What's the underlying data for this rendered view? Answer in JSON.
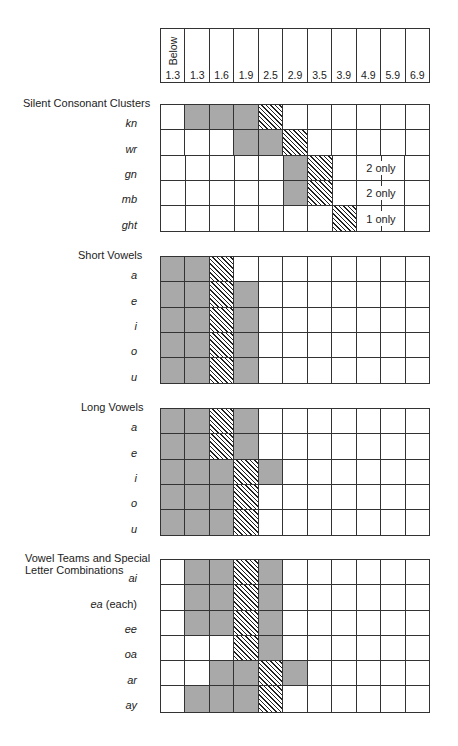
{
  "chart_data": {
    "type": "table",
    "title": "",
    "legend": {
      "gray": "shaded cell",
      "hatched": "diagonally hatched cell"
    },
    "columns": [
      "Below 1.3",
      "1.3",
      "1.6",
      "1.9",
      "2.5",
      "2.9",
      "3.5",
      "3.9",
      "4.9",
      "5.9",
      "6.9"
    ],
    "header": {
      "below_label": "Below",
      "values": [
        "1.3",
        "1.3",
        "1.6",
        "1.9",
        "2.5",
        "2.9",
        "3.5",
        "3.9",
        "4.9",
        "5.9",
        "6.9"
      ]
    },
    "sections": [
      {
        "title": "Silent Consonant Clusters",
        "rows": [
          {
            "label": "kn",
            "cells": [
              "",
              "g",
              "g",
              "g",
              "h",
              "",
              "",
              "",
              "",
              "",
              ""
            ]
          },
          {
            "label": "wr",
            "cells": [
              "",
              "",
              "",
              "g",
              "g",
              "h",
              "",
              "",
              "",
              "",
              ""
            ]
          },
          {
            "label": "gn",
            "cells": [
              "",
              "",
              "",
              "",
              "",
              "g",
              "h",
              "",
              "",
              "",
              ""
            ],
            "note": "2 only"
          },
          {
            "label": "mb",
            "cells": [
              "",
              "",
              "",
              "",
              "",
              "g",
              "h",
              "",
              "",
              "",
              ""
            ],
            "note": "2 only"
          },
          {
            "label": "ght",
            "cells": [
              "",
              "",
              "",
              "",
              "",
              "",
              "",
              "h",
              "",
              "",
              ""
            ],
            "note": "1 only"
          }
        ]
      },
      {
        "title": "Short Vowels",
        "rows": [
          {
            "label": "a",
            "cells": [
              "g",
              "g",
              "h",
              "",
              "",
              "",
              "",
              "",
              "",
              "",
              ""
            ]
          },
          {
            "label": "e",
            "cells": [
              "g",
              "g",
              "h",
              "g",
              "",
              "",
              "",
              "",
              "",
              "",
              ""
            ]
          },
          {
            "label": "i",
            "cells": [
              "g",
              "g",
              "h",
              "g",
              "",
              "",
              "",
              "",
              "",
              "",
              ""
            ]
          },
          {
            "label": "o",
            "cells": [
              "g",
              "g",
              "h",
              "g",
              "",
              "",
              "",
              "",
              "",
              "",
              ""
            ]
          },
          {
            "label": "u",
            "cells": [
              "g",
              "g",
              "h",
              "g",
              "",
              "",
              "",
              "",
              "",
              "",
              ""
            ]
          }
        ]
      },
      {
        "title": "Long Vowels",
        "rows": [
          {
            "label": "a",
            "cells": [
              "g",
              "g",
              "h",
              "g",
              "",
              "",
              "",
              "",
              "",
              "",
              ""
            ]
          },
          {
            "label": "e",
            "cells": [
              "g",
              "g",
              "h",
              "g",
              "",
              "",
              "",
              "",
              "",
              "",
              ""
            ]
          },
          {
            "label": "i",
            "cells": [
              "g",
              "g",
              "g",
              "h",
              "g",
              "",
              "",
              "",
              "",
              "",
              ""
            ]
          },
          {
            "label": "o",
            "cells": [
              "g",
              "g",
              "g",
              "h",
              "",
              "",
              "",
              "",
              "",
              "",
              ""
            ]
          },
          {
            "label": "u",
            "cells": [
              "g",
              "g",
              "g",
              "h",
              "",
              "",
              "",
              "",
              "",
              "",
              ""
            ]
          }
        ]
      },
      {
        "title_line1": "Vowel Teams and Special",
        "title_line2": "Letter Combinations",
        "rows": [
          {
            "label": "ai",
            "cells": [
              "",
              "g",
              "g",
              "h",
              "g",
              "",
              "",
              "",
              "",
              "",
              ""
            ]
          },
          {
            "label": "ea",
            "label_suffix": " (each)",
            "cells": [
              "",
              "g",
              "g",
              "h",
              "g",
              "",
              "",
              "",
              "",
              "",
              ""
            ]
          },
          {
            "label": "ee",
            "cells": [
              "",
              "g",
              "g",
              "h",
              "g",
              "",
              "",
              "",
              "",
              "",
              ""
            ]
          },
          {
            "label": "oa",
            "cells": [
              "",
              "",
              "",
              "h",
              "g",
              "",
              "",
              "",
              "",
              "",
              ""
            ]
          },
          {
            "label": "ar",
            "cells": [
              "",
              "",
              "g",
              "g",
              "h",
              "g",
              "",
              "",
              "",
              "",
              ""
            ]
          },
          {
            "label": "ay",
            "cells": [
              "",
              "g",
              "g",
              "g",
              "h",
              "",
              "",
              "",
              "",
              "",
              ""
            ]
          }
        ]
      }
    ],
    "colors": {
      "gray": "#a9a9a9",
      "hatch": "#222222",
      "grid": "#333333"
    }
  }
}
